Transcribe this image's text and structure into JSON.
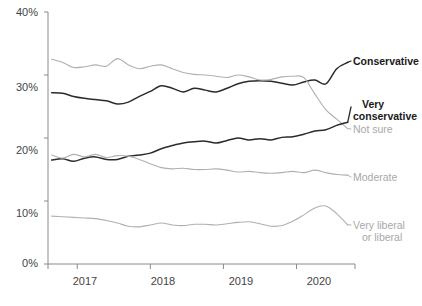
{
  "chart_data": {
    "type": "line",
    "title": "",
    "subtitle": "",
    "xlabel": "",
    "ylabel": "",
    "xlim": [
      2016.6,
      2020.8
    ],
    "ylim": [
      0,
      40
    ],
    "grid": false,
    "legend_position": "right-inline",
    "y_ticks": [
      "0%",
      "10%",
      "20%",
      "30%",
      "40%"
    ],
    "y_tick_values": [
      0,
      10,
      20,
      30,
      40
    ],
    "x_ticks": [
      "2017",
      "2018",
      "2019",
      "2020"
    ],
    "x_tick_values": [
      2017,
      2018,
      2019,
      2020
    ],
    "series": [
      {
        "name": "Conservative",
        "color": "#2b2b2b",
        "label_style": "dark",
        "x": [
          2016.65,
          2016.8,
          2016.95,
          2017.1,
          2017.25,
          2017.4,
          2017.55,
          2017.7,
          2017.85,
          2018.0,
          2018.15,
          2018.3,
          2018.45,
          2018.6,
          2018.75,
          2018.9,
          2019.05,
          2019.2,
          2019.35,
          2019.5,
          2019.65,
          2019.8,
          2019.95,
          2020.1,
          2020.25,
          2020.4,
          2020.55,
          2020.7
        ],
        "values": [
          27.2,
          27.1,
          26.6,
          26.3,
          26.1,
          25.9,
          25.4,
          25.7,
          26.6,
          27.4,
          28.3,
          27.9,
          27.3,
          27.9,
          27.6,
          27.3,
          27.9,
          28.6,
          29.0,
          29.1,
          29.0,
          28.7,
          28.4,
          28.9,
          29.2,
          28.6,
          31.0,
          32.0
        ]
      },
      {
        "name": "Not sure",
        "color": "#b0b0b0",
        "label_style": "gray",
        "x": [
          2016.65,
          2016.8,
          2016.95,
          2017.1,
          2017.25,
          2017.4,
          2017.55,
          2017.7,
          2017.85,
          2018.0,
          2018.15,
          2018.3,
          2018.45,
          2018.6,
          2018.75,
          2018.9,
          2019.05,
          2019.2,
          2019.35,
          2019.5,
          2019.65,
          2019.8,
          2019.95,
          2020.1,
          2020.25,
          2020.4,
          2020.55,
          2020.7
        ],
        "values": [
          32.5,
          32.0,
          31.2,
          31.3,
          31.6,
          31.4,
          32.6,
          31.6,
          31.0,
          31.4,
          31.6,
          31.0,
          30.4,
          30.1,
          30.0,
          29.8,
          29.6,
          30.0,
          29.7,
          29.2,
          29.3,
          29.7,
          29.8,
          29.6,
          27.0,
          24.5,
          23.0,
          21.5
        ]
      },
      {
        "name": "Very conservative",
        "color": "#2b2b2b",
        "label_style": "dark",
        "x": [
          2016.65,
          2016.8,
          2016.95,
          2017.1,
          2017.25,
          2017.4,
          2017.55,
          2017.7,
          2017.85,
          2018.0,
          2018.15,
          2018.3,
          2018.45,
          2018.6,
          2018.75,
          2018.9,
          2019.05,
          2019.2,
          2019.35,
          2019.5,
          2019.65,
          2019.8,
          2019.95,
          2020.1,
          2020.25,
          2020.4,
          2020.55,
          2020.7
        ],
        "values": [
          16.5,
          16.7,
          16.3,
          16.8,
          17.0,
          16.6,
          16.6,
          17.1,
          17.3,
          17.6,
          18.3,
          18.8,
          19.2,
          19.4,
          19.5,
          19.2,
          19.6,
          20.0,
          19.7,
          19.9,
          19.7,
          20.1,
          20.2,
          20.6,
          21.1,
          21.3,
          22.0,
          22.5
        ]
      },
      {
        "name": "Moderate",
        "color": "#b0b0b0",
        "label_style": "gray",
        "x": [
          2016.65,
          2016.8,
          2016.95,
          2017.1,
          2017.25,
          2017.4,
          2017.55,
          2017.7,
          2017.85,
          2018.0,
          2018.15,
          2018.3,
          2018.45,
          2018.6,
          2018.75,
          2018.9,
          2019.05,
          2019.2,
          2019.35,
          2019.5,
          2019.65,
          2019.8,
          2019.95,
          2020.1,
          2020.25,
          2020.4,
          2020.55,
          2020.7
        ],
        "values": [
          17.3,
          16.8,
          17.4,
          17.0,
          17.4,
          16.9,
          17.2,
          17.1,
          16.6,
          15.9,
          15.3,
          15.1,
          15.2,
          15.0,
          15.0,
          15.1,
          14.9,
          14.6,
          14.7,
          14.5,
          14.4,
          14.5,
          14.7,
          14.5,
          14.9,
          14.5,
          14.2,
          14.1
        ]
      },
      {
        "name": "Very liberal or liberal",
        "color": "#b0b0b0",
        "label_style": "gray",
        "x": [
          2016.65,
          2016.8,
          2016.95,
          2017.1,
          2017.25,
          2017.4,
          2017.55,
          2017.7,
          2017.85,
          2018.0,
          2018.15,
          2018.3,
          2018.45,
          2018.6,
          2018.75,
          2018.9,
          2019.05,
          2019.2,
          2019.35,
          2019.5,
          2019.65,
          2019.8,
          2019.95,
          2020.1,
          2020.25,
          2020.4,
          2020.55,
          2020.7
        ],
        "values": [
          7.6,
          7.5,
          7.4,
          7.3,
          7.2,
          6.9,
          6.5,
          6.0,
          5.9,
          6.2,
          6.5,
          6.2,
          6.1,
          6.3,
          6.3,
          6.2,
          6.4,
          6.6,
          6.7,
          6.4,
          6.0,
          6.1,
          6.8,
          7.8,
          8.9,
          9.2,
          8.0,
          6.2
        ]
      }
    ],
    "labels": [
      {
        "text": "Conservative",
        "style": "dark",
        "lines": [
          "Conservative"
        ]
      },
      {
        "text": "Very conservative",
        "style": "dark",
        "lines": [
          "Very",
          "conservative"
        ]
      },
      {
        "text": "Not sure",
        "style": "gray",
        "lines": [
          "Not sure"
        ]
      },
      {
        "text": "Moderate",
        "style": "gray",
        "lines": [
          "Moderate"
        ]
      },
      {
        "text": "Very liberal or liberal",
        "style": "gray",
        "lines": [
          "Very liberal",
          "or liberal"
        ]
      }
    ]
  },
  "axis": {
    "y_labels": {
      "t40": "40%",
      "t30": "30%",
      "t20": "20%",
      "t10": "10%",
      "t0": "0%"
    },
    "x_labels": {
      "y2017": "2017",
      "y2018": "2018",
      "y2019": "2019",
      "y2020": "2020"
    }
  },
  "annotations": {
    "conservative": "Conservative",
    "very_1": "Very",
    "very_2": "conservative",
    "not_sure": "Not sure",
    "moderate": "Moderate",
    "lib_1": "Very liberal",
    "lib_2": "or liberal"
  },
  "colors": {
    "dark_line": "#2b2b2b",
    "gray_line": "#b0b0b0",
    "axis": "#8a8a8a",
    "tick_text": "#444444",
    "dark_label": "#1a1a1a",
    "gray_label": "#a8a8a8"
  }
}
